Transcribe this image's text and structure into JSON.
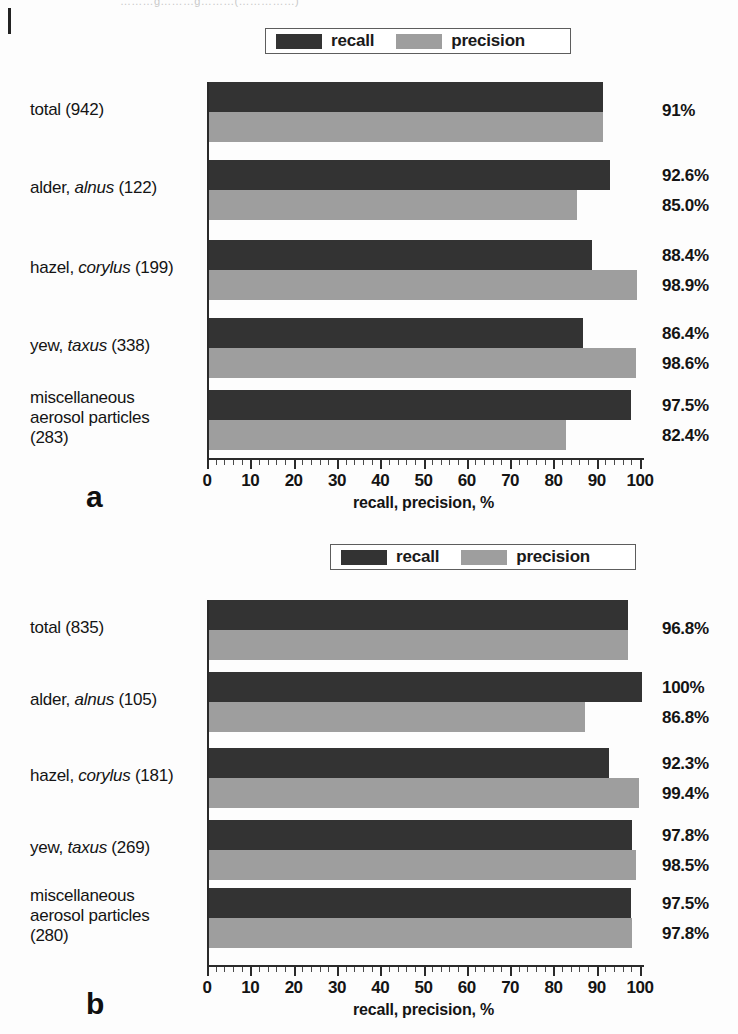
{
  "page": {
    "cutoff_header": "………g………g………(……………)",
    "axis_title": "recall, precision, %",
    "legend": {
      "recall_label": "recall",
      "precision_label": "precision",
      "recall_color": "#333333",
      "precision_color": "#9e9e9e"
    },
    "panel_a_letter": "a",
    "panel_b_letter": "b"
  },
  "chart_data": [
    {
      "id": "a",
      "type": "bar",
      "orientation": "horizontal",
      "title": "",
      "xlabel": "recall, precision, %",
      "ylabel": "",
      "xlim": [
        0,
        100
      ],
      "xticks": [
        0,
        10,
        20,
        30,
        40,
        50,
        60,
        70,
        80,
        90,
        100
      ],
      "xtick_labels": [
        "0",
        "10",
        "20",
        "30",
        "40",
        "50",
        "60",
        "70",
        "80",
        "90",
        "100"
      ],
      "minor_tick_step": 2,
      "grid": false,
      "legend_position": "top-center",
      "categories": [
        "total (942)",
        "alder, alnus (122)",
        "hazel, corylus (199)",
        "yew, taxus (338)",
        "miscellaneous aerosol particles (283)"
      ],
      "category_lines": [
        [
          "total (942)"
        ],
        [
          "alder, |alnus| (122)"
        ],
        [
          "hazel, |corylus| (199)"
        ],
        [
          "yew, |taxus| (338)"
        ],
        [
          "miscellaneous",
          "aerosol particles",
          "(283)"
        ]
      ],
      "series": [
        {
          "name": "recall",
          "values": [
            91.0,
            92.6,
            88.4,
            86.4,
            97.5
          ]
        },
        {
          "name": "precision",
          "values": [
            91.0,
            85.0,
            98.9,
            98.6,
            82.4
          ]
        }
      ],
      "value_labels": [
        {
          "recall": "91%",
          "precision": ""
        },
        {
          "recall": "92.6%",
          "precision": "85.0%"
        },
        {
          "recall": "88.4%",
          "precision": "98.9%"
        },
        {
          "recall": "86.4%",
          "precision": "98.6%"
        },
        {
          "recall": "97.5%",
          "precision": "82.4%"
        }
      ]
    },
    {
      "id": "b",
      "type": "bar",
      "orientation": "horizontal",
      "title": "",
      "xlabel": "recall, precision, %",
      "ylabel": "",
      "xlim": [
        0,
        100
      ],
      "xticks": [
        0,
        10,
        20,
        30,
        40,
        50,
        60,
        70,
        80,
        90,
        100
      ],
      "xtick_labels": [
        "0",
        "10",
        "20",
        "30",
        "40",
        "50",
        "60",
        "70",
        "80",
        "90",
        "100"
      ],
      "minor_tick_step": 2,
      "grid": false,
      "legend_position": "top-center",
      "categories": [
        "total (835)",
        "alder, alnus (105)",
        "hazel, corylus (181)",
        "yew, taxus (269)",
        "miscellaneous aerosol particles (280)"
      ],
      "category_lines": [
        [
          "total (835)"
        ],
        [
          "alder, |alnus| (105)"
        ],
        [
          "hazel, |corylus| (181)"
        ],
        [
          "yew, |taxus| (269)"
        ],
        [
          "miscellaneous",
          "aerosol particles",
          "(280)"
        ]
      ],
      "series": [
        {
          "name": "recall",
          "values": [
            96.8,
            100.0,
            92.3,
            97.8,
            97.5
          ]
        },
        {
          "name": "precision",
          "values": [
            96.8,
            86.8,
            99.4,
            98.5,
            97.8
          ]
        }
      ],
      "value_labels": [
        {
          "recall": "96.8%",
          "precision": ""
        },
        {
          "recall": "100%",
          "precision": "86.8%"
        },
        {
          "recall": "92.3%",
          "precision": "99.4%"
        },
        {
          "recall": "97.8%",
          "precision": "98.5%"
        },
        {
          "recall": "97.5%",
          "precision": "97.8%"
        }
      ]
    }
  ]
}
